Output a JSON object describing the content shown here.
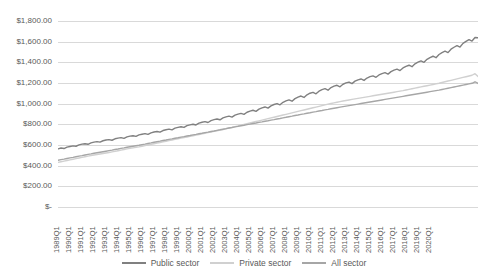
{
  "chart_data": {
    "type": "line",
    "title": "",
    "xlabel": "",
    "ylabel": "",
    "ylim": [
      0,
      1800
    ],
    "ytick_values": [
      1800,
      1600,
      1400,
      1200,
      1000,
      800,
      600,
      400,
      200,
      0
    ],
    "ytick_labels": [
      "$1,800.00",
      "$1,600.00",
      "$1,400.00",
      "$1,200.00",
      "$1,000.00",
      "$800.00",
      "$600.00",
      "$400.00",
      "$200.00",
      "$-"
    ],
    "grid": true,
    "legend_position": "bottom",
    "x_tick_labels": [
      "1989Q1",
      "1990Q1",
      "1991Q1",
      "1992Q1",
      "1993Q1",
      "1994Q1",
      "1995Q1",
      "1996Q1",
      "1997Q1",
      "1998Q1",
      "1999Q1",
      "2000Q1",
      "2001Q1",
      "2002Q1",
      "2003Q1",
      "2004Q1",
      "2005Q1",
      "2006Q1",
      "2007Q1",
      "2008Q1",
      "2009Q1",
      "2010Q1",
      "2011Q1",
      "2012Q1",
      "2013Q1",
      "2014Q1",
      "2015Q1",
      "2016Q1",
      "2017Q1",
      "2018Q1",
      "2019Q1",
      "2020Q1"
    ],
    "x_start": "1989Q1",
    "x_end": "2020Q1",
    "x_frequency": "quarterly",
    "series": [
      {
        "name": "Public sector",
        "color": "#808080",
        "values": [
          562,
          571,
          566,
          580,
          586,
          592,
          588,
          601,
          608,
          612,
          607,
          620,
          628,
          633,
          628,
          641,
          648,
          652,
          646,
          660,
          666,
          671,
          664,
          679,
          686,
          690,
          684,
          698,
          704,
          710,
          703,
          718,
          726,
          731,
          724,
          740,
          748,
          754,
          747,
          763,
          771,
          777,
          770,
          787,
          795,
          801,
          794,
          811,
          820,
          826,
          818,
          836,
          845,
          852,
          844,
          862,
          872,
          879,
          870,
          889,
          899,
          906,
          897,
          917,
          928,
          936,
          926,
          947,
          959,
          968,
          957,
          979,
          992,
          1001,
          989,
          1013,
          1027,
          1037,
          1024,
          1049,
          1064,
          1074,
          1060,
          1086,
          1101,
          1110,
          1095,
          1121,
          1136,
          1145,
          1130,
          1156,
          1170,
          1178,
          1163,
          1188,
          1201,
          1209,
          1194,
          1218,
          1231,
          1239,
          1225,
          1248,
          1261,
          1269,
          1255,
          1278,
          1291,
          1300,
          1286,
          1310,
          1324,
          1334,
          1320,
          1346,
          1361,
          1372,
          1358,
          1386,
          1402,
          1414,
          1400,
          1429,
          1446,
          1459,
          1445,
          1476,
          1494,
          1508,
          1494,
          1527,
          1546,
          1562,
          1548,
          1583,
          1603,
          1620,
          1606,
          1641,
          1638
        ]
      },
      {
        "name": "Private sector",
        "color": "#d0d0d0",
        "values": [
          432,
          438,
          444,
          450,
          456,
          462,
          468,
          474,
          480,
          486,
          492,
          498,
          503,
          508,
          513,
          518,
          523,
          528,
          533,
          538,
          544,
          550,
          556,
          562,
          567,
          572,
          577,
          582,
          588,
          594,
          600,
          606,
          612,
          618,
          624,
          630,
          636,
          642,
          648,
          654,
          660,
          666,
          672,
          678,
          684,
          690,
          696,
          702,
          708,
          714,
          720,
          726,
          732,
          738,
          744,
          750,
          757,
          764,
          771,
          778,
          785,
          792,
          799,
          806,
          813,
          820,
          827,
          834,
          841,
          848,
          855,
          862,
          869,
          876,
          883,
          890,
          897,
          904,
          911,
          918,
          925,
          932,
          939,
          946,
          953,
          960,
          967,
          974,
          981,
          988,
          995,
          1002,
          1008,
          1014,
          1020,
          1026,
          1031,
          1036,
          1041,
          1046,
          1051,
          1056,
          1061,
          1066,
          1071,
          1076,
          1081,
          1086,
          1091,
          1096,
          1101,
          1106,
          1111,
          1116,
          1121,
          1126,
          1132,
          1138,
          1144,
          1150,
          1156,
          1162,
          1168,
          1174,
          1180,
          1186,
          1192,
          1198,
          1205,
          1212,
          1219,
          1226,
          1233,
          1240,
          1247,
          1254,
          1261,
          1268,
          1275,
          1290,
          1262
        ]
      },
      {
        "name": "All sector",
        "color": "#a6a6a6",
        "values": [
          452,
          458,
          463,
          469,
          475,
          480,
          486,
          492,
          497,
          503,
          509,
          514,
          520,
          525,
          530,
          535,
          540,
          545,
          550,
          556,
          561,
          567,
          572,
          578,
          583,
          588,
          593,
          598,
          604,
          609,
          615,
          620,
          626,
          632,
          637,
          643,
          648,
          654,
          659,
          665,
          670,
          676,
          681,
          687,
          692,
          698,
          703,
          709,
          714,
          720,
          725,
          731,
          736,
          742,
          747,
          753,
          758,
          764,
          769,
          775,
          780,
          786,
          791,
          797,
          802,
          808,
          813,
          819,
          824,
          830,
          835,
          841,
          846,
          852,
          857,
          863,
          868,
          874,
          879,
          885,
          890,
          896,
          901,
          907,
          912,
          918,
          923,
          929,
          934,
          940,
          945,
          951,
          956,
          961,
          966,
          971,
          976,
          981,
          986,
          991,
          996,
          1001,
          1006,
          1011,
          1016,
          1021,
          1026,
          1031,
          1036,
          1041,
          1046,
          1051,
          1056,
          1061,
          1066,
          1071,
          1076,
          1081,
          1086,
          1091,
          1096,
          1101,
          1106,
          1111,
          1116,
          1121,
          1126,
          1131,
          1137,
          1143,
          1149,
          1155,
          1161,
          1167,
          1173,
          1179,
          1185,
          1191,
          1197,
          1212,
          1196
        ]
      }
    ]
  },
  "legend": {
    "items": [
      {
        "label": "Public sector"
      },
      {
        "label": "Private sector"
      },
      {
        "label": "All sector"
      }
    ]
  }
}
